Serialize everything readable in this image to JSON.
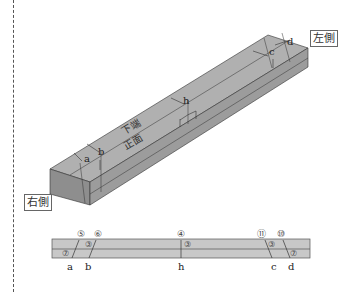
{
  "labels": {
    "left_side": "左側",
    "right_side": "右側",
    "top_face": "下端",
    "front_face": "正面"
  },
  "iso_points": [
    "a",
    "b",
    "h",
    "c",
    "d"
  ],
  "strip": {
    "circled_numbers": [
      "⑤",
      "⑥",
      "④",
      "⑪",
      "⑩"
    ],
    "inner_marks": [
      "⑦",
      "③",
      "③",
      "③",
      "⑦"
    ],
    "bottom_letters": [
      "a",
      "b",
      "h",
      "c",
      "d"
    ]
  },
  "colors": {
    "beam_face": "#9a9a9a",
    "beam_top": "#b0b0b0",
    "beam_side": "#888888",
    "strip_fill": "#c8c8c8",
    "line": "#333333"
  }
}
